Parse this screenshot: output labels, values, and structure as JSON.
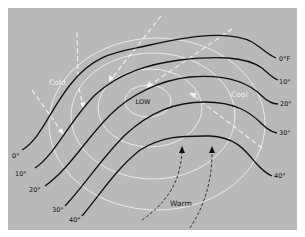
{
  "diagram": {
    "center_label": "LOW",
    "air_mass_labels": {
      "cold": "Cold",
      "cool": "Cool",
      "warm": "Warm"
    },
    "isotherms": [
      {
        "id": "0",
        "right_label": "0°F",
        "left_label": "0°"
      },
      {
        "id": "10",
        "right_label": "10°",
        "left_label": "10°"
      },
      {
        "id": "20",
        "right_label": "20°",
        "left_label": "20°"
      },
      {
        "id": "30",
        "right_label": "30°",
        "left_label": "30°"
      },
      {
        "id": "40",
        "right_label": "40°",
        "left_label": "40°"
      }
    ],
    "isobar_count": 4,
    "wind_arrows": {
      "cold_flow_count": 6,
      "warm_flow_count": 2
    },
    "colors": {
      "background": "#b9b9b9",
      "isotherm": "#111111",
      "isobar": "#eeeeee",
      "cold_wind": "#f2f2f2",
      "warm_wind": "#222222"
    }
  }
}
